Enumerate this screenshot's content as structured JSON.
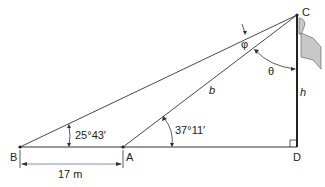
{
  "diagram": {
    "points": {
      "B": {
        "label": "B",
        "x": 20,
        "y": 147
      },
      "A": {
        "label": "A",
        "x": 123,
        "y": 147
      },
      "D": {
        "label": "D",
        "x": 297,
        "y": 147
      },
      "C": {
        "label": "C",
        "x": 297,
        "y": 15
      }
    },
    "angles": {
      "angle_B": "25°43′",
      "angle_A": "37°11′",
      "phi": "φ",
      "theta": "θ"
    },
    "lengths": {
      "BA": "17 m",
      "AC": "b",
      "CD": "h"
    },
    "colors": {
      "line": "#333333",
      "flag": "#c8c8c8",
      "dimension": "#7777dd"
    }
  }
}
